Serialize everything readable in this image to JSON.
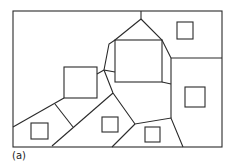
{
  "figure": {
    "label": "(a)",
    "stroke_color": "#2a2a2a"
  }
}
